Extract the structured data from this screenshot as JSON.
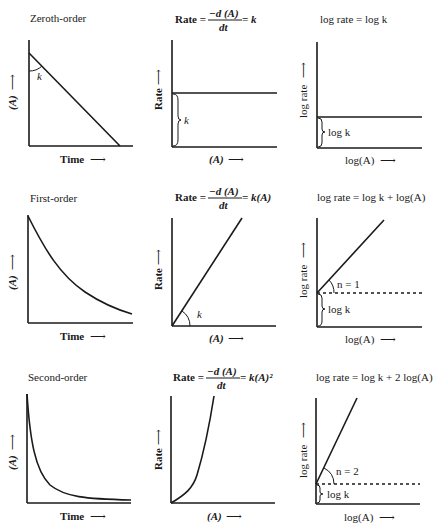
{
  "rows": [
    {
      "order_label": "Zeroth-order",
      "rate_eq": {
        "prefix": "Rate = ",
        "num": "−d (A)",
        "den": "dt",
        "suffix": " = k"
      },
      "log_eq": "log rate = log k",
      "conc_plot": {
        "ylabel": "(A)",
        "xlabel": "Time",
        "slope_label": "k"
      },
      "rate_plot": {
        "ylabel": "Rate",
        "xlabel": "(A)",
        "brace_label": "k"
      },
      "log_plot": {
        "ylabel": "log rate",
        "xlabel": "log(A)",
        "brace_label": "log k"
      }
    },
    {
      "order_label": "First-order",
      "rate_eq": {
        "prefix": "Rate = ",
        "num": "−d (A)",
        "den": "dt",
        "suffix": " = k(A)"
      },
      "log_eq": "log rate = log k + log(A)",
      "conc_plot": {
        "ylabel": "(A)",
        "xlabel": "Time"
      },
      "rate_plot": {
        "ylabel": "Rate",
        "xlabel": "(A)",
        "angle_label": "k"
      },
      "log_plot": {
        "ylabel": "log rate",
        "xlabel": "log(A)",
        "angle_label": "n = 1",
        "brace_label": "log k"
      }
    },
    {
      "order_label": "Second-order",
      "rate_eq": {
        "prefix": "Rate = ",
        "num": "−d (A)",
        "den": "dt",
        "suffix": " = k(A)²"
      },
      "log_eq": "log rate = log k + 2 log(A)",
      "conc_plot": {
        "ylabel": "(A)",
        "xlabel": "Time"
      },
      "rate_plot": {
        "ylabel": "Rate",
        "xlabel": "(A)"
      },
      "log_plot": {
        "ylabel": "log rate",
        "xlabel": "log(A)",
        "angle_label": "n = 2",
        "brace_label": "log k"
      }
    }
  ],
  "arrow": "⟶",
  "up_arrow": "⟶"
}
